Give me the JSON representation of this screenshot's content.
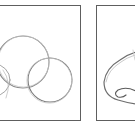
{
  "figure": {
    "panels": [
      {
        "id": "step-circles",
        "description": "Construction circles for nose sketch",
        "shapes": [
          {
            "type": "circle",
            "cx": 23,
            "cy": 62,
            "r": 26,
            "role": "nose-bulb"
          },
          {
            "type": "circle",
            "cx": 50,
            "cy": 80,
            "r": 22,
            "role": "right-nostril-wing"
          },
          {
            "type": "circle",
            "cx": -6,
            "cy": 80,
            "r": 16,
            "role": "left-nostril-wing"
          }
        ]
      },
      {
        "id": "step-outline",
        "description": "Refined nose outline with nostril",
        "shapes": [
          {
            "type": "path",
            "role": "nose-outline"
          },
          {
            "type": "path",
            "role": "nostril-curl"
          }
        ]
      }
    ],
    "colors": {
      "frame": "#5e5e5e",
      "stroke_dark": "#6a6a6a",
      "stroke_light": "#b8b8b8",
      "background": "#ffffff"
    }
  }
}
